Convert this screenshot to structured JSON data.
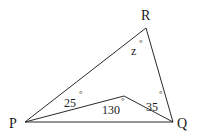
{
  "diagram": {
    "type": "geometry-triangle",
    "vertices": {
      "P": {
        "label": "P",
        "x": 25,
        "y": 122
      },
      "Q": {
        "label": "Q",
        "x": 173,
        "y": 122
      },
      "R": {
        "label": "R",
        "x": 146,
        "y": 28
      },
      "S": {
        "label": "",
        "x": 124,
        "y": 96
      }
    },
    "segments": [
      [
        "P",
        "Q"
      ],
      [
        "P",
        "R"
      ],
      [
        "R",
        "Q"
      ],
      [
        "P",
        "S"
      ],
      [
        "S",
        "Q"
      ]
    ],
    "angles": {
      "z": {
        "text": "z",
        "unit": "°",
        "at": "R"
      },
      "a25": {
        "text": "25",
        "unit": "°",
        "at": "P",
        "between": "PR and PS"
      },
      "a130": {
        "text": "130",
        "unit": "°",
        "at": "S",
        "between": "PS and SQ"
      },
      "a35": {
        "text": "35",
        "unit": "°",
        "at": "Q",
        "between": "QR and QS"
      }
    },
    "colors": {
      "line": "#2a2a2a",
      "text": "#1a1a1a",
      "background": "#ffffff"
    }
  }
}
